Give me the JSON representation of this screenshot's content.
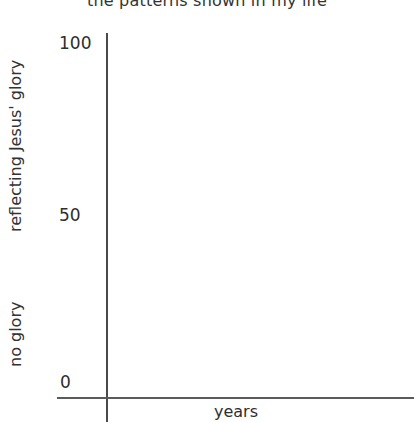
{
  "chart_data": {
    "type": "line",
    "title": "the patterns shown in my life",
    "xlabel": "years",
    "ylabel": "",
    "y_annotations": [
      "reflecting Jesus' glory",
      "no glory"
    ],
    "yticks": [
      0,
      50,
      100
    ],
    "ylim": [
      0,
      100
    ],
    "xticks": [],
    "series": [],
    "grid": false,
    "legend": null
  },
  "labels": {
    "title": "the patterns shown in my life",
    "x_axis": "years",
    "y_high": "reflecting Jesus' glory",
    "y_low": "no glory",
    "tick_100": "100",
    "tick_50": "50",
    "tick_0": "0"
  }
}
